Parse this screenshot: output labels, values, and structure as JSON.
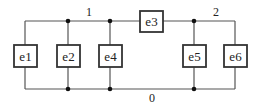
{
  "diagram": {
    "type": "circuit-graph",
    "nodes": [
      {
        "id": "node-1",
        "label": "1"
      },
      {
        "id": "node-2",
        "label": "2"
      },
      {
        "id": "node-0",
        "label": "0"
      }
    ],
    "elements": [
      {
        "id": "e1",
        "label": "e1",
        "between": [
          "1",
          "0"
        ]
      },
      {
        "id": "e2",
        "label": "e2",
        "between": [
          "1",
          "0"
        ]
      },
      {
        "id": "e4",
        "label": "e4",
        "between": [
          "1",
          "0"
        ]
      },
      {
        "id": "e3",
        "label": "e3",
        "between": [
          "1",
          "2"
        ]
      },
      {
        "id": "e5",
        "label": "e5",
        "between": [
          "2",
          "0"
        ]
      },
      {
        "id": "e6",
        "label": "e6",
        "between": [
          "2",
          "0"
        ]
      }
    ],
    "colors": {
      "wire": "#555555",
      "box_border": "#333333",
      "junction": "#111111",
      "text": "#222222"
    }
  }
}
